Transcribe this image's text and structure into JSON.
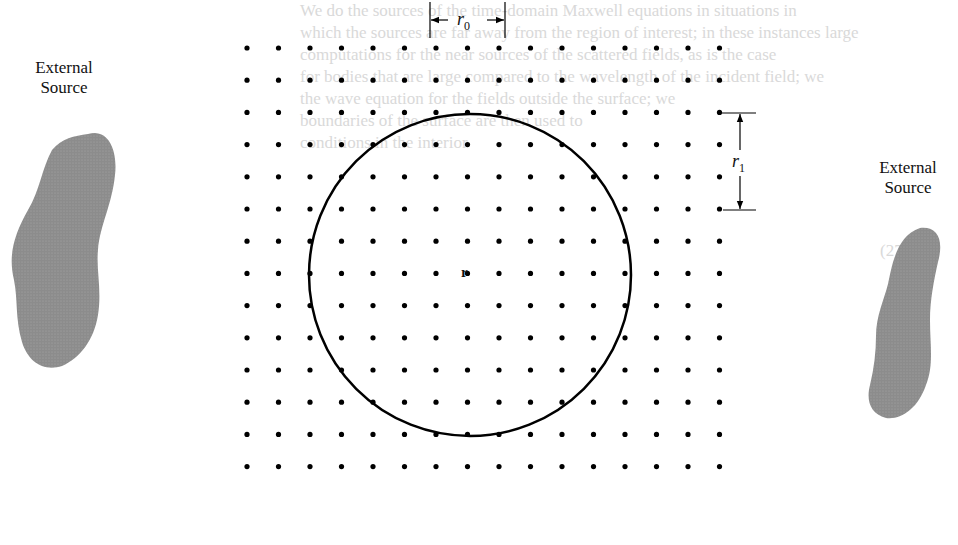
{
  "figure": {
    "type": "physics diagram",
    "grid": {
      "columns": 16,
      "rows": 14,
      "x_start": 247,
      "x_step": 31.5,
      "y_start": 48,
      "y_step": 32.2,
      "dot_color": "#000000"
    },
    "circle": {
      "cx": 470,
      "cy": 275,
      "radius": 161,
      "stroke": "#000000"
    },
    "labels": {
      "r0": {
        "symbol": "r",
        "subscript": "0"
      },
      "r1": {
        "symbol": "r",
        "subscript": "1"
      },
      "r": {
        "symbol": "r"
      },
      "left_source": {
        "line1": "External",
        "line2": "Source"
      },
      "right_source": {
        "line1": "External",
        "line2": "Source"
      }
    },
    "blob_fill": "#8c8c8c"
  },
  "bleed_through_text": {
    "color": "#d9d9d9",
    "lines": [
      "We do the sources of the time-domain Maxwell equations in situations in",
      "which the sources are far away from the region of interest; in these instances large",
      "computations for the near sources of the scattered fields, as is the case",
      "for bodies that are large compared to the wavelength of the incident field; we",
      "the wave equation for the fields outside the surface; we",
      "boundaries of the surface are then used to",
      "conditions in the interior",
      "(27.21)",
      "(27.22)"
    ]
  }
}
